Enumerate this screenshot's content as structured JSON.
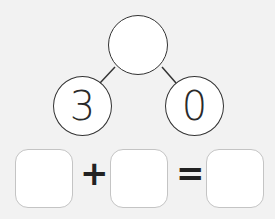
{
  "number_bond": {
    "whole": "",
    "part_left": "3",
    "part_right": "0"
  },
  "equation": {
    "addend1": "",
    "plus": "+",
    "addend2": "",
    "equals": "=",
    "sum": ""
  }
}
